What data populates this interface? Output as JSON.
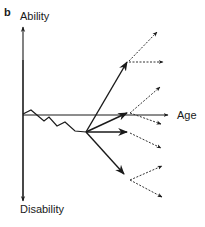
{
  "figure": {
    "panel_label": "b",
    "y_axis_top_label": "Ability",
    "y_axis_bottom_label": "Disability",
    "x_axis_label": "Age"
  },
  "colors": {
    "line": "#1a1a1a",
    "dotted": "#333333",
    "background": "#ffffff"
  }
}
